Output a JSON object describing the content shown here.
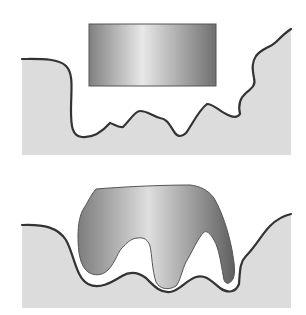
{
  "figure": {
    "panels": [
      {
        "id": "top",
        "label": "",
        "objects": [
          "rectangular-block",
          "rough-surface"
        ]
      },
      {
        "id": "bottom",
        "label": "",
        "objects": [
          "deformed-block",
          "rough-surface"
        ]
      }
    ]
  },
  "colors": {
    "background": "#ffffff",
    "surface_fill": "#dcdcdc",
    "outline": "#333333",
    "block_dark": "#7a7a7a",
    "block_light": "#e6e6e6"
  }
}
